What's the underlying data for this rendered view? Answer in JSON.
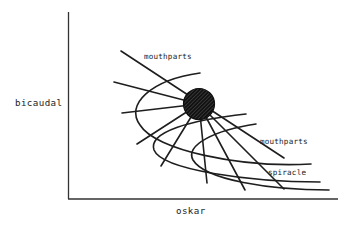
{
  "figure": {
    "x_axis_label": "oskar",
    "y_axis_label": "bicaudal",
    "labels": {
      "mouthparts_top": "mouthparts",
      "mouthparts_right": "mouthparts",
      "spiracle": "spiracle"
    },
    "center_marker": "hatched-circle",
    "colors": {
      "ink": "#1e1e1e",
      "background": "#ffffff"
    }
  }
}
